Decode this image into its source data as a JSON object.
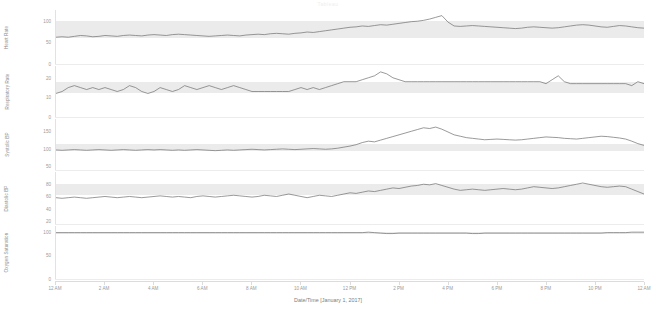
{
  "header": {
    "watermark": "Tableau"
  },
  "axis": {
    "x_title": "Date/Time [January 1, 2017]",
    "x_ticks": [
      "12 AM",
      "2 AM",
      "4 AM",
      "6 AM",
      "8 AM",
      "10 AM",
      "12 PM",
      "2 PM",
      "4 PM",
      "6 PM",
      "8 PM",
      "10 PM",
      "12 AM"
    ]
  },
  "colors": {
    "line": "#6e6e6e",
    "band": "#e8e8e8",
    "axis": "#9a9a9a",
    "grid": "#e2e2e2",
    "background": "#ffffff"
  },
  "panels": [
    {
      "name": "heart-rate",
      "label": "Heart Rate",
      "ticks": [
        "100",
        "50",
        "0"
      ],
      "tick_values": [
        100,
        50,
        0
      ],
      "ylim": [
        0,
        125
      ],
      "normal_band": [
        60,
        100
      ]
    },
    {
      "name": "respiratory-rate",
      "label": "Respiratory Rate",
      "ticks": [
        "20",
        "10",
        "0"
      ],
      "tick_values": [
        20,
        10,
        0
      ],
      "ylim": [
        0,
        26
      ],
      "normal_band": [
        12,
        18
      ]
    },
    {
      "name": "systolic-bp",
      "label": "Systolic BP",
      "ticks": [
        "150",
        "100",
        "50"
      ],
      "tick_values": [
        150,
        100,
        50
      ],
      "ylim": [
        40,
        185
      ],
      "normal_band": [
        95,
        115
      ]
    },
    {
      "name": "diastolic-bp",
      "label": "Diastolic BP",
      "ticks": [
        "80",
        "60",
        "40",
        "20"
      ],
      "tick_values": [
        80,
        60,
        40,
        20
      ],
      "ylim": [
        15,
        100
      ],
      "normal_band": [
        62,
        80
      ]
    },
    {
      "name": "oxygen-saturation",
      "label": "Oxygen Saturation",
      "ticks": [
        "100",
        "50",
        "0"
      ],
      "tick_values": [
        100,
        50,
        0
      ],
      "ylim": [
        0,
        112
      ],
      "normal_band": [
        95,
        100
      ]
    }
  ],
  "chart_data": {
    "type": "line",
    "title": "",
    "xlabel": "Date/Time [January 1, 2017]",
    "grid": false,
    "legend": "none",
    "x": [
      0,
      0.25,
      0.5,
      0.75,
      1,
      1.25,
      1.5,
      1.75,
      2,
      2.25,
      2.5,
      2.75,
      3,
      3.25,
      3.5,
      3.75,
      4,
      4.25,
      4.5,
      4.75,
      5,
      5.25,
      5.5,
      5.75,
      6,
      6.25,
      6.5,
      6.75,
      7,
      7.25,
      7.5,
      7.75,
      8,
      8.25,
      8.5,
      8.75,
      9,
      9.25,
      9.5,
      9.75,
      10,
      10.25,
      10.5,
      10.75,
      11,
      11.25,
      11.5,
      11.75,
      12,
      12.25,
      12.5,
      12.75,
      13,
      13.25,
      13.5,
      13.75,
      14,
      14.25,
      14.5,
      14.75,
      15,
      15.25,
      15.5,
      15.75,
      16,
      16.25,
      16.5,
      16.75,
      17,
      17.25,
      17.5,
      17.75,
      18,
      18.25,
      18.5,
      18.75,
      19,
      19.25,
      19.5,
      19.75,
      20,
      20.25,
      20.5,
      20.75,
      21,
      21.25,
      21.5,
      21.75,
      22,
      22.25,
      22.5,
      22.75,
      23,
      23.25,
      23.5,
      23.75,
      24
    ],
    "x_tick_labels": [
      "12 AM",
      "2 AM",
      "4 AM",
      "6 AM",
      "8 AM",
      "10 AM",
      "12 PM",
      "2 PM",
      "4 PM",
      "6 PM",
      "8 PM",
      "10 PM",
      "12 AM"
    ],
    "series": [
      {
        "name": "Heart Rate",
        "ylabel": "Heart Rate",
        "unit": "bpm",
        "ylim": [
          0,
          125
        ],
        "normal_band": [
          60,
          100
        ],
        "values": [
          62,
          63,
          62,
          64,
          66,
          65,
          63,
          64,
          66,
          65,
          64,
          66,
          67,
          66,
          65,
          67,
          68,
          67,
          66,
          68,
          69,
          68,
          67,
          66,
          65,
          64,
          65,
          66,
          67,
          66,
          65,
          67,
          68,
          69,
          68,
          70,
          71,
          70,
          69,
          71,
          72,
          74,
          73,
          75,
          77,
          79,
          81,
          83,
          85,
          86,
          88,
          87,
          89,
          91,
          90,
          92,
          94,
          96,
          98,
          99,
          101,
          104,
          108,
          112,
          97,
          88,
          87,
          88,
          89,
          88,
          87,
          86,
          85,
          84,
          83,
          82,
          83,
          85,
          86,
          85,
          84,
          83,
          84,
          86,
          88,
          90,
          91,
          90,
          88,
          86,
          85,
          87,
          89,
          88,
          86,
          84,
          83
        ]
      },
      {
        "name": "Respiratory Rate",
        "ylabel": "Respiratory Rate",
        "unit": "breaths/min",
        "ylim": [
          0,
          26
        ],
        "normal_band": [
          12,
          18
        ],
        "values": [
          12,
          13,
          15,
          16,
          15,
          14,
          15,
          14,
          15,
          14,
          13,
          14,
          16,
          15,
          13,
          12,
          13,
          15,
          14,
          13,
          14,
          16,
          15,
          14,
          15,
          16,
          15,
          14,
          15,
          16,
          15,
          14,
          13,
          13,
          13,
          13,
          13,
          13,
          13,
          14,
          15,
          14,
          15,
          14,
          15,
          16,
          17,
          18,
          18,
          18,
          19,
          20,
          21,
          23,
          22,
          20,
          19,
          18,
          18,
          18,
          18,
          18,
          18,
          18,
          18,
          18,
          18,
          18,
          18,
          18,
          18,
          18,
          18,
          18,
          18,
          18,
          18,
          18,
          18,
          18,
          17,
          19,
          21,
          18,
          17,
          17,
          17,
          17,
          17,
          17,
          17,
          17,
          17,
          17,
          16,
          18,
          17
        ]
      },
      {
        "name": "Systolic BP",
        "ylabel": "Systolic BP",
        "unit": "mmHg",
        "ylim": [
          40,
          185
        ],
        "normal_band": [
          95,
          115
        ],
        "values": [
          97,
          96,
          97,
          98,
          97,
          96,
          97,
          98,
          97,
          96,
          97,
          98,
          97,
          96,
          97,
          98,
          97,
          98,
          97,
          96,
          97,
          96,
          97,
          98,
          97,
          96,
          95,
          96,
          97,
          96,
          97,
          98,
          99,
          98,
          97,
          98,
          99,
          100,
          99,
          98,
          99,
          100,
          101,
          100,
          99,
          100,
          102,
          105,
          108,
          112,
          118,
          122,
          120,
          125,
          130,
          135,
          140,
          145,
          150,
          155,
          160,
          158,
          162,
          156,
          148,
          140,
          136,
          132,
          130,
          128,
          126,
          127,
          128,
          127,
          126,
          125,
          126,
          128,
          130,
          132,
          134,
          133,
          132,
          130,
          129,
          128,
          130,
          132,
          134,
          136,
          135,
          133,
          131,
          128,
          122,
          115,
          110
        ]
      },
      {
        "name": "Diastolic BP",
        "ylabel": "Diastolic BP",
        "unit": "mmHg",
        "ylim": [
          15,
          100
        ],
        "normal_band": [
          62,
          80
        ],
        "values": [
          58,
          57,
          58,
          59,
          58,
          57,
          58,
          59,
          60,
          59,
          58,
          59,
          60,
          59,
          58,
          59,
          60,
          61,
          60,
          59,
          60,
          59,
          58,
          60,
          61,
          60,
          59,
          60,
          61,
          62,
          61,
          60,
          59,
          60,
          62,
          61,
          60,
          62,
          64,
          62,
          60,
          58,
          60,
          62,
          61,
          60,
          62,
          64,
          66,
          65,
          67,
          69,
          68,
          70,
          72,
          74,
          73,
          75,
          77,
          78,
          80,
          79,
          81,
          78,
          75,
          72,
          70,
          71,
          72,
          71,
          70,
          71,
          72,
          73,
          72,
          71,
          72,
          74,
          76,
          75,
          74,
          73,
          74,
          76,
          78,
          80,
          82,
          80,
          78,
          76,
          75,
          76,
          77,
          76,
          72,
          68,
          64
        ]
      },
      {
        "name": "Oxygen Saturation",
        "ylabel": "Oxygen Saturation",
        "unit": "%",
        "ylim": [
          0,
          112
        ],
        "normal_band": [
          95,
          100
        ],
        "values": [
          98,
          98,
          98,
          98,
          98,
          98,
          98,
          98,
          98,
          98,
          98,
          98,
          98,
          98,
          98,
          98,
          98,
          98,
          98,
          98,
          98,
          98,
          98,
          98,
          98,
          98,
          98,
          98,
          98,
          98,
          98,
          98,
          98,
          98,
          98,
          98,
          98,
          98,
          98,
          98,
          98,
          98,
          98,
          98,
          98,
          98,
          98,
          98,
          98,
          98,
          98,
          99,
          98,
          97,
          96,
          96,
          97,
          97,
          97,
          97,
          97,
          97,
          97,
          97,
          97,
          97,
          97,
          97,
          96,
          96,
          97,
          97,
          97,
          97,
          97,
          97,
          97,
          97,
          97,
          97,
          97,
          97,
          97,
          97,
          97,
          97,
          97,
          97,
          97,
          97,
          98,
          98,
          98,
          98,
          99,
          99,
          99
        ]
      }
    ]
  }
}
